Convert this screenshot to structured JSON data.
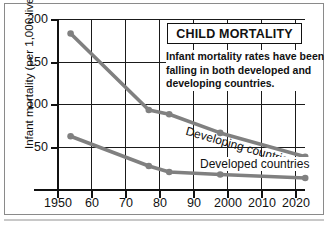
{
  "chart_data": {
    "type": "line",
    "title": "CHILD MORTALITY",
    "caption": [
      "Infant mortality rates have been",
      "falling in both developed and",
      "developing countries."
    ],
    "xlabel": "",
    "ylabel": "Infant mortality (per 1,000 live births)",
    "xlim": [
      1947,
      2026
    ],
    "ylim": [
      0,
      200
    ],
    "yticks": [
      200,
      150,
      100,
      50
    ],
    "ytick_labels": [
      "200",
      "150",
      "100",
      "50"
    ],
    "xticks": [
      1950,
      1960,
      1970,
      1980,
      1990,
      2000,
      2010,
      2020
    ],
    "xtick_labels": [
      "1950",
      "60",
      "70",
      "80",
      "90",
      "2000",
      "2010",
      "2020"
    ],
    "grid": true,
    "legend_position": "inline-labels",
    "series": [
      {
        "name": "Developing countries",
        "color": "#808080",
        "x": [
          1954,
          1977,
          1983,
          1998,
          2023
        ],
        "values": [
          183,
          93,
          88,
          66,
          38
        ]
      },
      {
        "name": "Developed countries",
        "color": "#808080",
        "x": [
          1954,
          1977,
          1983,
          1998,
          2023
        ],
        "values": [
          62,
          27,
          20,
          17,
          13
        ]
      }
    ]
  },
  "colors": {
    "series_gray": "#808080",
    "axis": "#111111",
    "grid": "#1a1a1a",
    "frame": "#8a8a8a",
    "background": "#ffffff"
  }
}
